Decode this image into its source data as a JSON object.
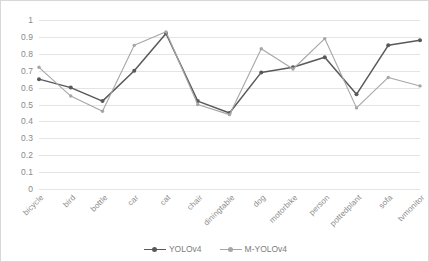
{
  "chart_data": {
    "type": "line",
    "title": "",
    "xlabel": "",
    "ylabel": "",
    "ylim": [
      0,
      1
    ],
    "ytick_step": 0.1,
    "grid": true,
    "legend_position": "bottom-center",
    "categories": [
      "bicycle",
      "bird",
      "bottle",
      "car",
      "cat",
      "chair",
      "diningtable",
      "dog",
      "motorbike",
      "person",
      "pottedplant",
      "sofa",
      "tvmonitor"
    ],
    "yticks": [
      "1",
      "0.9",
      "0.8",
      "0.7",
      "0.6",
      "0.5",
      "0.4",
      "0.3",
      "0.2",
      "0.1",
      "0"
    ],
    "series": [
      {
        "name": "YOLOv4",
        "color": "#595959",
        "marker": "circle",
        "values": [
          0.65,
          0.6,
          0.52,
          0.7,
          0.92,
          0.52,
          0.45,
          0.69,
          0.72,
          0.78,
          0.56,
          0.85,
          0.88
        ]
      },
      {
        "name": "M-YOLOv4",
        "color": "#a6a6a6",
        "marker": "circle",
        "values": [
          0.72,
          0.55,
          0.46,
          0.85,
          0.93,
          0.5,
          0.44,
          0.83,
          0.71,
          0.89,
          0.48,
          0.66,
          0.61
        ]
      }
    ]
  },
  "legend": {
    "entries": [
      {
        "label": "YOLOv4"
      },
      {
        "label": "M-YOLOv4"
      }
    ]
  },
  "colors": {
    "series_1": "#595959",
    "series_2": "#a6a6a6",
    "gridline": "#e4e4e4",
    "axis_text": "#8a8a8a",
    "background": "#ffffff",
    "border": "#d8d8d8"
  }
}
